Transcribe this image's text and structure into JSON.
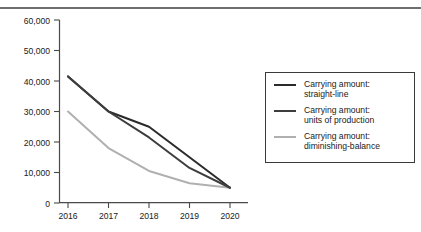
{
  "figure": {
    "background_color": "#ffffff",
    "rule_color": "#6e6e6e"
  },
  "chart_data": {
    "type": "line",
    "title": "",
    "xlabel": "",
    "ylabel": "",
    "categories": [
      "2016",
      "2017",
      "2018",
      "2019",
      "2020"
    ],
    "x": [
      2016,
      2017,
      2018,
      2019,
      2020
    ],
    "xlim": [
      2016,
      2020
    ],
    "ylim": [
      0,
      60000
    ],
    "y_ticks": [
      0,
      10000,
      20000,
      30000,
      40000,
      50000,
      60000
    ],
    "y_tick_labels": [
      "0",
      "10,000",
      "20,000",
      "30,000",
      "40,000",
      "50,000",
      "60,000"
    ],
    "x_tick_labels": [
      "2016",
      "2017",
      "2018",
      "2019",
      "2020"
    ],
    "grid": false,
    "legend_position": "right",
    "series": [
      {
        "name": "Carrying amount: straight-line",
        "label_line1": "Carrying amount:",
        "label_line2": "straight-line",
        "color": "#2b2b2b",
        "values": [
          41500,
          30000,
          25000,
          15000,
          5000
        ]
      },
      {
        "name": "Carrying amount: units of production",
        "label_line1": "Carrying amount:",
        "label_line2": "units of production",
        "color": "#3d3d3d",
        "values": [
          41500,
          30000,
          21500,
          11500,
          5000
        ]
      },
      {
        "name": "Carrying amount: diminishing-balance",
        "label_line1": "Carrying amount:",
        "label_line2": "diminishing-balance",
        "color": "#b0b0b0",
        "values": [
          30000,
          18000,
          10500,
          6500,
          5000
        ]
      }
    ]
  }
}
